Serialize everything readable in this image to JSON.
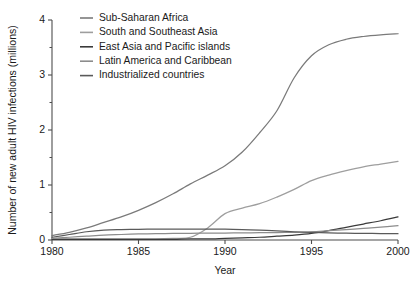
{
  "chart_data": {
    "type": "line",
    "title": "",
    "xlabel": "Year",
    "ylabel": "Number of new adult HIV infections (millions)",
    "xlim": [
      1980,
      2000
    ],
    "ylim": [
      0,
      4
    ],
    "xticks": [
      1980,
      1985,
      1990,
      1995,
      2000
    ],
    "xtick_labels": [
      "1980",
      "1985",
      "1990",
      "1995",
      "2000"
    ],
    "yticks": [
      0,
      1,
      2,
      3,
      4
    ],
    "ytick_labels": [
      "0",
      "1",
      "2",
      "3",
      "4"
    ],
    "yminorticks": [
      0.5,
      1.5,
      2.5,
      3.5
    ],
    "grid": false,
    "legend_position": "upper-left",
    "x": [
      1980,
      1981,
      1982,
      1983,
      1984,
      1985,
      1986,
      1987,
      1988,
      1989,
      1990,
      1991,
      1992,
      1993,
      1994,
      1995,
      1996,
      1997,
      1998,
      1999,
      2000
    ],
    "series": [
      {
        "name": "Sub-Saharan Africa",
        "color": "#7a7a7a",
        "values": [
          0.08,
          0.14,
          0.22,
          0.32,
          0.42,
          0.54,
          0.68,
          0.84,
          1.02,
          1.18,
          1.35,
          1.6,
          1.95,
          2.35,
          2.95,
          3.35,
          3.55,
          3.65,
          3.7,
          3.73,
          3.75
        ]
      },
      {
        "name": "South and Southeast Asia",
        "color": "#9e9e9e",
        "values": [
          0.02,
          0.02,
          0.02,
          0.02,
          0.02,
          0.02,
          0.02,
          0.03,
          0.05,
          0.22,
          0.48,
          0.58,
          0.66,
          0.78,
          0.92,
          1.08,
          1.18,
          1.26,
          1.33,
          1.38,
          1.43
        ]
      },
      {
        "name": "East Asia and Pacific islands",
        "color": "#3a3a3a",
        "values": [
          0.01,
          0.01,
          0.01,
          0.01,
          0.01,
          0.01,
          0.01,
          0.01,
          0.02,
          0.02,
          0.03,
          0.04,
          0.05,
          0.07,
          0.09,
          0.12,
          0.17,
          0.23,
          0.29,
          0.35,
          0.42
        ]
      },
      {
        "name": "Latin America and Caribbean",
        "color": "#8c8c8c",
        "values": [
          0.03,
          0.05,
          0.07,
          0.09,
          0.1,
          0.11,
          0.115,
          0.12,
          0.122,
          0.125,
          0.127,
          0.13,
          0.132,
          0.135,
          0.14,
          0.15,
          0.17,
          0.19,
          0.21,
          0.235,
          0.26
        ]
      },
      {
        "name": "Industrialized countries",
        "color": "#5a5a5a",
        "values": [
          0.05,
          0.1,
          0.15,
          0.18,
          0.19,
          0.195,
          0.197,
          0.198,
          0.198,
          0.198,
          0.197,
          0.19,
          0.18,
          0.165,
          0.15,
          0.14,
          0.13,
          0.125,
          0.12,
          0.118,
          0.115
        ]
      }
    ]
  }
}
